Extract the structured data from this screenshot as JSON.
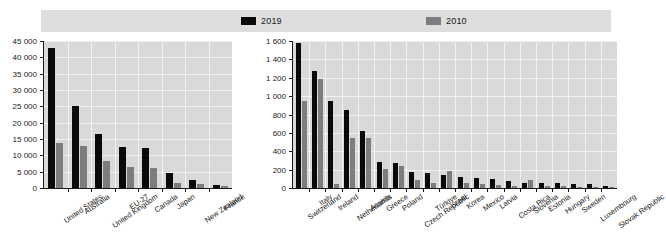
{
  "legend": {
    "items": [
      {
        "label": "2019",
        "color": "#0a0a0a"
      },
      {
        "label": "2010",
        "color": "#7d7d7d"
      }
    ]
  },
  "colors": {
    "series_2019": "#0a0a0a",
    "series_2010": "#7d7d7d",
    "plot_background": "#d9d9d9",
    "legend_background": "#dedede",
    "gridline": "#f2f2f2",
    "axis": "#1a1a1a",
    "text": "#1a1a1a"
  },
  "chart_data": [
    {
      "type": "bar",
      "id": "left-chart",
      "title": "",
      "xlabel": "",
      "ylabel": "",
      "ylim": [
        0,
        45000
      ],
      "yticks": [
        0,
        5000,
        10000,
        15000,
        20000,
        25000,
        30000,
        35000,
        40000,
        45000
      ],
      "ytick_labels": [
        "0",
        "5 000",
        "10 000",
        "15 000",
        "20 000",
        "25 000",
        "30 000",
        "35 000",
        "40 000",
        "45 000"
      ],
      "grid": true,
      "legend_position": "top",
      "categories": [
        "United States",
        "Australia",
        "United Kingdom",
        "EU-27",
        "Canada",
        "Japan",
        "New Zealand",
        "France"
      ],
      "series": [
        {
          "name": "2019",
          "values": [
            42800,
            25000,
            16400,
            12600,
            12200,
            4500,
            2500,
            900
          ]
        },
        {
          "name": "2010",
          "values": [
            13700,
            12900,
            8300,
            6500,
            6100,
            1600,
            1100,
            600
          ]
        }
      ]
    },
    {
      "type": "bar",
      "id": "right-chart",
      "title": "",
      "xlabel": "",
      "ylabel": "",
      "ylim": [
        0,
        1600
      ],
      "yticks": [
        0,
        200,
        400,
        600,
        800,
        1000,
        1200,
        1400,
        1600
      ],
      "ytick_labels": [
        "0",
        "200",
        "400",
        "600",
        "800",
        "1 000",
        "1 200",
        "1 400",
        "1 600"
      ],
      "grid": true,
      "legend_position": "top",
      "categories": [
        "Switzerland",
        "Italy",
        "Ireland",
        "Netherlands",
        "Austria",
        "Greece",
        "Poland",
        "Czech Republic",
        "Türkiye",
        "Israel",
        "Korea",
        "Mexico",
        "Latvia",
        "Costa Rica",
        "Slovenia",
        "Estonia",
        "Hungary",
        "Sweden",
        "Luxembourg",
        "Slovak Republic"
      ],
      "series": [
        {
          "name": "2019",
          "values": [
            1580,
            1275,
            950,
            845,
            620,
            280,
            275,
            170,
            165,
            145,
            120,
            110,
            95,
            80,
            60,
            55,
            50,
            45,
            40,
            25
          ]
        },
        {
          "name": "2010",
          "values": [
            950,
            1185,
            45,
            540,
            545,
            210,
            240,
            90,
            60,
            185,
            50,
            40,
            30,
            25,
            90,
            20,
            18,
            15,
            14,
            10
          ]
        }
      ]
    }
  ]
}
